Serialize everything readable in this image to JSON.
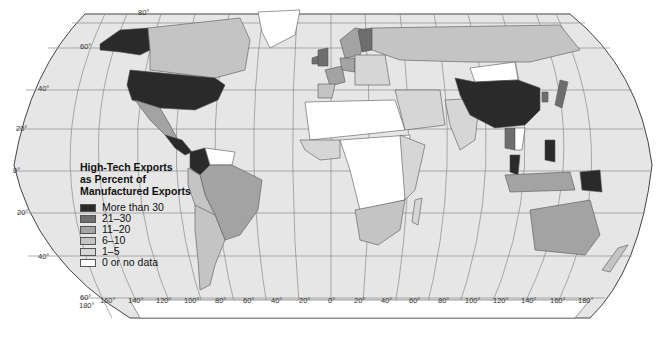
{
  "map": {
    "title": "High-Tech Exports as Percent of Manufactured Exports",
    "projection": "Robinson",
    "colors": {
      "ocean": "#e6e6e6",
      "graticule": "#8a8a8a",
      "border": "#555555",
      "background": "#ffffff"
    }
  },
  "legend": {
    "title_lines": [
      "High-Tech Exports",
      "as Percent of",
      "Manufactured Exports"
    ],
    "items": [
      {
        "label": "More than 30",
        "color": "#2a2a2a"
      },
      {
        "label": "21–30",
        "color": "#6e6e6e"
      },
      {
        "label": "11–20",
        "color": "#a3a3a3"
      },
      {
        "label": "6–10",
        "color": "#c4c4c4"
      },
      {
        "label": "1–5",
        "color": "#d6d6d6"
      },
      {
        "label": "0 or no data",
        "color": "#ffffff"
      }
    ]
  },
  "latitude_labels": {
    "n80": "80°",
    "n60": "60°",
    "n40": "40°",
    "n20": "20°",
    "eq": "0°",
    "s20": "20°",
    "s40": "40°",
    "s60": "60°"
  },
  "longitude_labels": [
    "180°",
    "160°",
    "140°",
    "120°",
    "100°",
    "80°",
    "60°",
    "40°",
    "20°",
    "0°",
    "20°",
    "40°",
    "60°",
    "80°",
    "100°",
    "120°",
    "140°",
    "160°",
    "180°"
  ],
  "regions": {
    "more_than_30": [
      "United States",
      "Alaska",
      "China",
      "Colombia",
      "Philippines",
      "Malaysia",
      "Papua New Guinea",
      "Central America (part)"
    ],
    "21_30": [
      "United Kingdom",
      "Ireland",
      "Finland",
      "Japan",
      "Korea",
      "Thailand"
    ],
    "11_20": [
      "Brazil",
      "Australia",
      "Mexico",
      "France",
      "Sweden",
      "Indonesia",
      "Germany"
    ],
    "6_10": [
      "Canada",
      "Argentina",
      "South Africa",
      "Russia"
    ],
    "0_or_no_data": [
      "Greenland",
      "Mongolia",
      "Central Africa (many)",
      "Sahara region"
    ]
  }
}
